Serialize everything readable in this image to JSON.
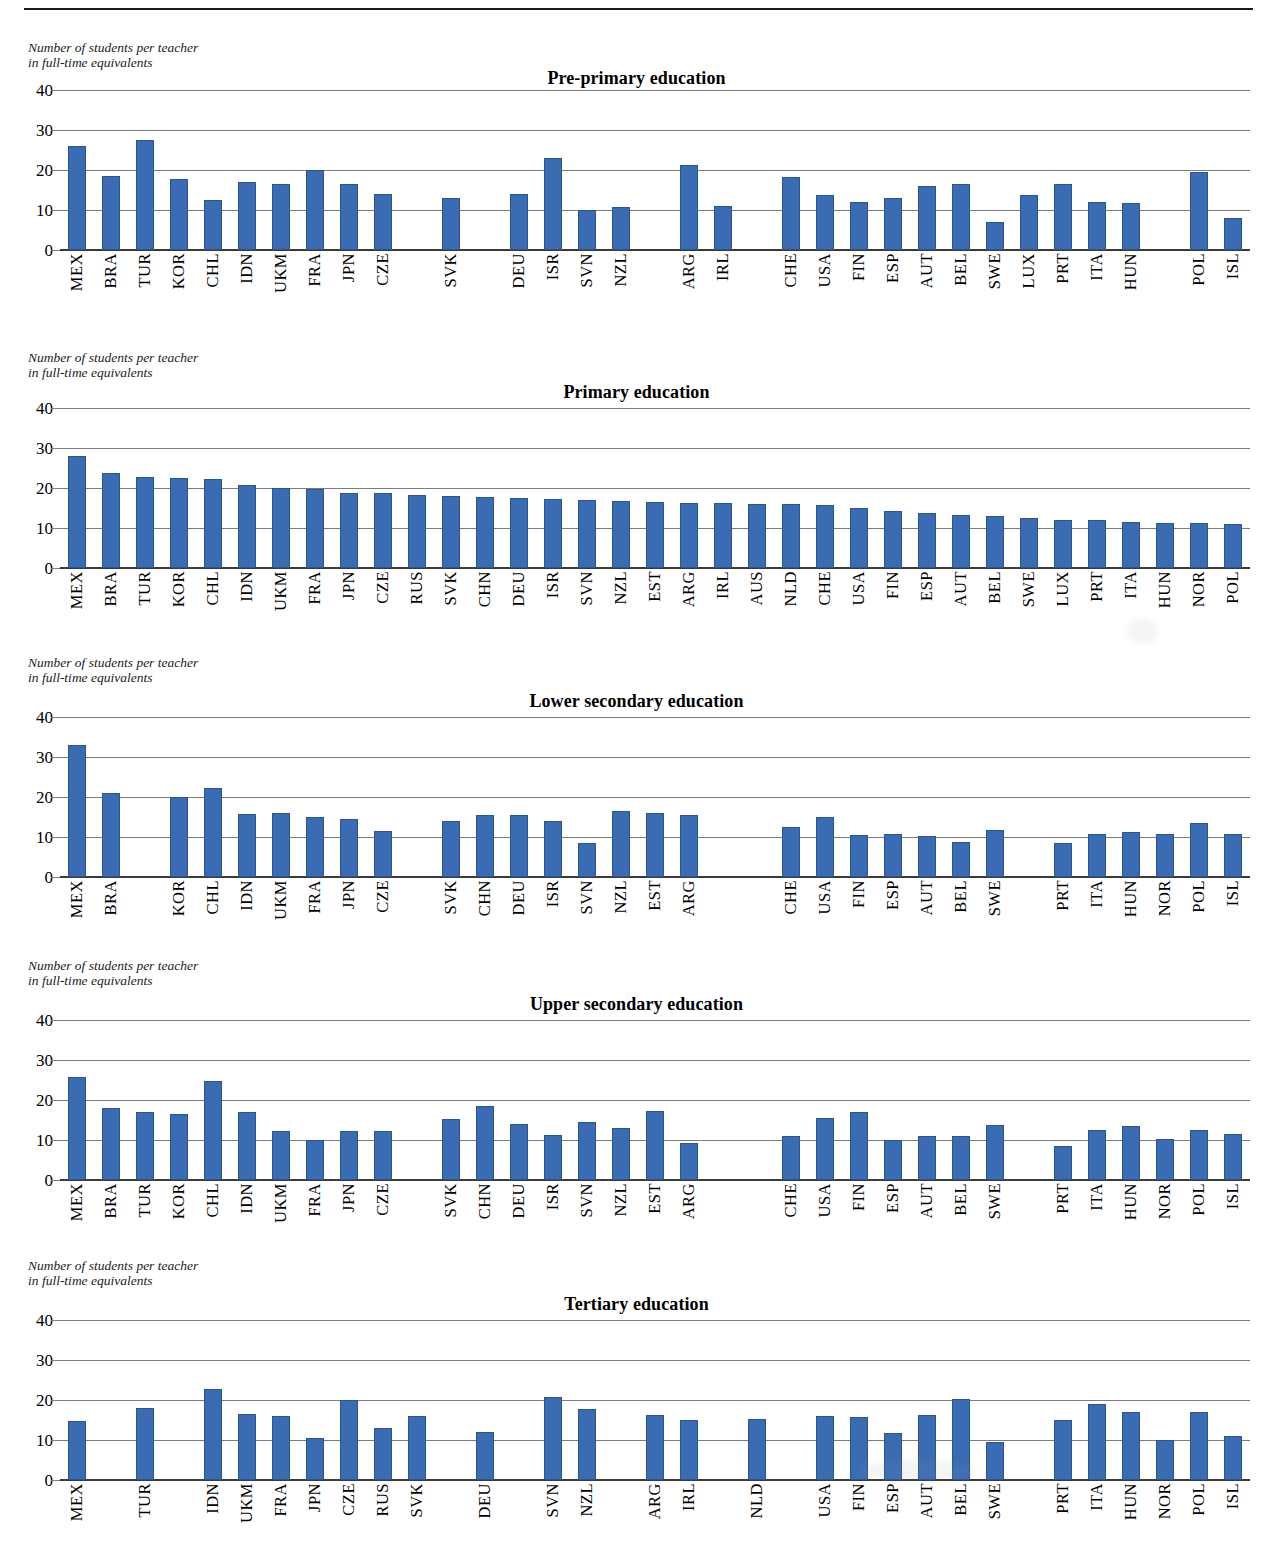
{
  "page": {
    "header_title_partial": "Ratio of students to teaching staff (2012)",
    "axis_note": "Number of students per teacher\nin full-time equivalents",
    "bar_color": "#3a6cb4",
    "gridline_color": "#7d7d7d",
    "axis_color": "#3a3a3a"
  },
  "chart_data": [
    {
      "type": "bar",
      "title": "Pre-primary education",
      "xlabel": "",
      "ylabel": "Number of students per teacher in full-time equivalents",
      "ylim": [
        0,
        40
      ],
      "yticks": [
        0,
        10,
        20,
        30,
        40
      ],
      "grid": true,
      "legend": "none",
      "categories": [
        "MEX",
        "BRA",
        "TUR",
        "KOR",
        "CHL",
        "IDN",
        "UKM",
        "FRA",
        "JPN",
        "CZE",
        "",
        "SVK",
        "",
        "DEU",
        "ISR",
        "SVN",
        "NZL",
        "",
        "ARG",
        "IRL",
        "",
        "CHE",
        "USA",
        "FIN",
        "ESP",
        "AUT",
        "BEL",
        "SWE",
        "LUX",
        "PRT",
        "ITA",
        "HUN",
        "",
        "POL",
        "ISL"
      ],
      "values": [
        25.9,
        18.4,
        27.5,
        17.7,
        12.4,
        17.0,
        16.6,
        20.1,
        16.6,
        14.1,
        null,
        13.1,
        null,
        14.0,
        23.0,
        9.9,
        10.8,
        null,
        21.3,
        11.1,
        null,
        18.2,
        13.7,
        11.9,
        12.9,
        16.0,
        16.5,
        7.0,
        13.7,
        16.5,
        11.9,
        11.8,
        null,
        19.4,
        7.9
      ]
    },
    {
      "type": "bar",
      "title": "Primary education",
      "xlabel": "",
      "ylabel": "Number of students per teacher in full-time equivalents",
      "ylim": [
        0,
        40
      ],
      "yticks": [
        0,
        10,
        20,
        30,
        40
      ],
      "grid": true,
      "legend": "none",
      "categories": [
        "MEX",
        "BRA",
        "TUR",
        "KOR",
        "CHL",
        "IDN",
        "UKM",
        "FRA",
        "JPN",
        "CZE",
        "RUS",
        "SVK",
        "CHN",
        "DEU",
        "ISR",
        "SVN",
        "NZL",
        "EST",
        "ARG",
        "IRL",
        "AUS",
        "NLD",
        "CHE",
        "USA",
        "FIN",
        "ESP",
        "AUT",
        "BEL",
        "SWE",
        "LUX",
        "PRT",
        "ITA",
        "HUN",
        "NOR",
        "POL"
      ],
      "values": [
        28.0,
        23.8,
        22.8,
        22.4,
        22.2,
        20.8,
        20.1,
        19.8,
        18.8,
        18.7,
        18.2,
        17.9,
        17.8,
        17.5,
        17.2,
        17.0,
        16.7,
        16.5,
        16.3,
        16.2,
        16.1,
        16.0,
        15.7,
        15.1,
        14.2,
        13.8,
        13.2,
        13.0,
        12.6,
        12.1,
        11.9,
        11.4,
        11.3,
        11.3,
        10.9
      ]
    },
    {
      "type": "bar",
      "title": "Lower secondary education",
      "xlabel": "",
      "ylabel": "Number of students per teacher in full-time equivalents",
      "ylim": [
        0,
        40
      ],
      "yticks": [
        0,
        10,
        20,
        30,
        40
      ],
      "grid": true,
      "legend": "none",
      "categories": [
        "MEX",
        "BRA",
        "",
        "KOR",
        "CHL",
        "IDN",
        "UKM",
        "FRA",
        "JPN",
        "CZE",
        "",
        "SVK",
        "CHN",
        "DEU",
        "ISR",
        "SVN",
        "NZL",
        "EST",
        "ARG",
        "",
        "",
        "CHE",
        "USA",
        "FIN",
        "ESP",
        "AUT",
        "BEL",
        "SWE",
        "",
        "PRT",
        "ITA",
        "HUN",
        "NOR",
        "POL",
        "ISL"
      ],
      "values": [
        32.9,
        21.0,
        null,
        20.1,
        22.3,
        15.8,
        16.0,
        14.9,
        14.6,
        11.5,
        null,
        14.1,
        15.5,
        15.4,
        14.0,
        8.6,
        16.6,
        15.9,
        15.6,
        null,
        null,
        12.4,
        14.9,
        10.6,
        10.7,
        10.3,
        8.8,
        11.8,
        null,
        8.4,
        10.8,
        11.3,
        10.8,
        13.5,
        10.8
      ]
    },
    {
      "type": "bar",
      "title": "Upper secondary education",
      "xlabel": "",
      "ylabel": "Number of students per teacher in full-time equivalents",
      "ylim": [
        0,
        40
      ],
      "yticks": [
        0,
        10,
        20,
        30,
        40
      ],
      "grid": true,
      "legend": "none",
      "categories": [
        "MEX",
        "BRA",
        "TUR",
        "KOR",
        "CHL",
        "IDN",
        "UKM",
        "FRA",
        "JPN",
        "CZE",
        "",
        "SVK",
        "CHN",
        "DEU",
        "ISR",
        "SVN",
        "NZL",
        "EST",
        "ARG",
        "",
        "",
        "CHE",
        "USA",
        "FIN",
        "ESP",
        "AUT",
        "BEL",
        "SWE",
        "",
        "PRT",
        "ITA",
        "HUN",
        "NOR",
        "POL",
        "ISL"
      ],
      "values": [
        25.7,
        18.1,
        16.9,
        16.6,
        24.8,
        16.9,
        12.3,
        10.0,
        12.2,
        12.3,
        null,
        15.2,
        18.5,
        14.0,
        11.2,
        14.5,
        13.1,
        17.2,
        9.2,
        null,
        null,
        10.9,
        15.6,
        17.1,
        10.1,
        10.9,
        10.9,
        13.8,
        null,
        8.5,
        12.5,
        13.4,
        10.3,
        12.6,
        11.6
      ]
    },
    {
      "type": "bar",
      "title": "Tertiary education",
      "xlabel": "",
      "ylabel": "Number of students per teacher in full-time equivalents",
      "ylim": [
        0,
        40
      ],
      "yticks": [
        0,
        10,
        20,
        30,
        40
      ],
      "grid": true,
      "legend": "none",
      "categories": [
        "MEX",
        "",
        "TUR",
        "",
        "IDN",
        "UKM",
        "FRA",
        "JPN",
        "CZE",
        "RUS",
        "SVK",
        "",
        "DEU",
        "",
        "SVN",
        "NZL",
        "",
        "ARG",
        "IRL",
        "",
        "NLD",
        "",
        "USA",
        "FIN",
        "ESP",
        "AUT",
        "BEL",
        "SWE",
        "",
        "PRT",
        "ITA",
        "HUN",
        "NOR",
        "POL",
        "ISL"
      ],
      "values": [
        14.8,
        null,
        17.9,
        null,
        22.7,
        16.6,
        15.9,
        10.4,
        19.9,
        12.9,
        15.9,
        null,
        12.1,
        null,
        20.8,
        17.8,
        null,
        16.2,
        15.0,
        null,
        15.2,
        null,
        15.9,
        15.7,
        11.7,
        16.3,
        20.3,
        9.6,
        null,
        15.1,
        19.1,
        17.0,
        10.1,
        16.9,
        11.1
      ]
    }
  ]
}
